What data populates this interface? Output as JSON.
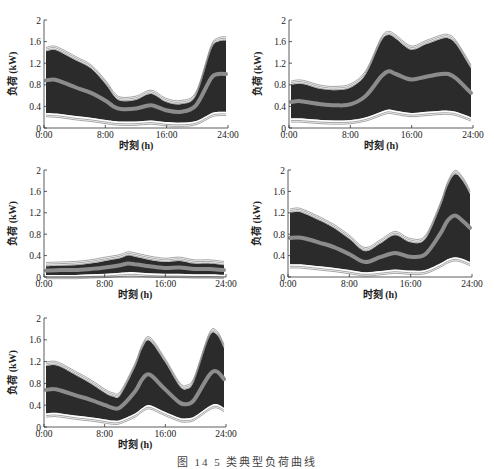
{
  "colors": {
    "band": "#2b2b2b",
    "band_edge": "#6a6a6a",
    "mean": "#8c8c8c",
    "axis": "#333333"
  },
  "caption": "图 14  5 类典型负荷曲线",
  "chart_data": [
    {
      "type": "area",
      "title": "",
      "xlabel": "时刻 (h)",
      "ylabel": "负荷 (kW)",
      "xticks": [
        "0:00",
        "8:00",
        "16:00",
        "24:00"
      ],
      "yticks": [
        "0",
        "0.4",
        "0.8",
        "1.2",
        "1.6",
        "2"
      ],
      "ylim": [
        0,
        2
      ],
      "xlim": [
        0,
        24
      ],
      "x": [
        0,
        1,
        2,
        4,
        6,
        8,
        9,
        10,
        12,
        14,
        16,
        18,
        20,
        22,
        23,
        24
      ],
      "series": [
        {
          "name": "upper",
          "values": [
            1.42,
            1.45,
            1.4,
            1.25,
            1.1,
            0.8,
            0.6,
            0.5,
            0.52,
            0.63,
            0.48,
            0.44,
            0.6,
            1.45,
            1.6,
            1.62
          ]
        },
        {
          "name": "mean",
          "values": [
            0.88,
            0.9,
            0.86,
            0.75,
            0.65,
            0.5,
            0.4,
            0.35,
            0.36,
            0.42,
            0.33,
            0.3,
            0.42,
            0.92,
            1.0,
            1.0
          ]
        },
        {
          "name": "lower",
          "values": [
            0.28,
            0.27,
            0.26,
            0.22,
            0.19,
            0.15,
            0.13,
            0.12,
            0.12,
            0.14,
            0.11,
            0.1,
            0.13,
            0.27,
            0.3,
            0.3
          ]
        }
      ]
    },
    {
      "type": "area",
      "title": "",
      "xlabel": "时刻 (h)",
      "ylabel": "负荷 (kW)",
      "xticks": [
        "0:00",
        "8:00",
        "16:00",
        "24:00"
      ],
      "yticks": [
        "0",
        "0.4",
        "0.8",
        "1.2",
        "1.6",
        "2"
      ],
      "ylim": [
        0,
        2
      ],
      "xlim": [
        0,
        24
      ],
      "x": [
        0,
        1,
        2,
        4,
        6,
        8,
        10,
        12,
        13,
        14,
        16,
        18,
        20,
        21,
        22,
        24
      ],
      "series": [
        {
          "name": "upper",
          "values": [
            0.8,
            0.82,
            0.8,
            0.72,
            0.7,
            0.75,
            1.0,
            1.6,
            1.72,
            1.65,
            1.45,
            1.55,
            1.65,
            1.66,
            1.55,
            1.1
          ]
        },
        {
          "name": "mean",
          "values": [
            0.48,
            0.5,
            0.48,
            0.44,
            0.42,
            0.44,
            0.6,
            0.95,
            1.05,
            1.0,
            0.9,
            0.95,
            1.0,
            1.0,
            0.92,
            0.65
          ]
        },
        {
          "name": "lower",
          "values": [
            0.18,
            0.18,
            0.17,
            0.15,
            0.14,
            0.15,
            0.2,
            0.3,
            0.34,
            0.32,
            0.28,
            0.3,
            0.32,
            0.32,
            0.3,
            0.2
          ]
        }
      ]
    },
    {
      "type": "area",
      "title": "",
      "xlabel": "时刻 (h)",
      "ylabel": "负荷 (kW)",
      "xticks": [
        "0:00",
        "8:00",
        "16:00",
        "24:00"
      ],
      "yticks": [
        "0",
        "0.4",
        "0.8",
        "1.2",
        "1.6",
        "2"
      ],
      "ylim": [
        0,
        2
      ],
      "xlim": [
        0,
        24
      ],
      "x": [
        0,
        2,
        4,
        6,
        8,
        10,
        11,
        12,
        14,
        16,
        18,
        20,
        22,
        24
      ],
      "series": [
        {
          "name": "upper",
          "values": [
            0.2,
            0.21,
            0.22,
            0.25,
            0.3,
            0.35,
            0.4,
            0.38,
            0.32,
            0.28,
            0.3,
            0.25,
            0.25,
            0.22
          ]
        },
        {
          "name": "mean",
          "values": [
            0.12,
            0.13,
            0.13,
            0.15,
            0.18,
            0.22,
            0.25,
            0.24,
            0.2,
            0.17,
            0.18,
            0.15,
            0.15,
            0.13
          ]
        },
        {
          "name": "lower",
          "values": [
            0.04,
            0.04,
            0.04,
            0.05,
            0.06,
            0.08,
            0.09,
            0.09,
            0.07,
            0.06,
            0.06,
            0.05,
            0.05,
            0.04
          ]
        }
      ]
    },
    {
      "type": "area",
      "title": "",
      "xlabel": "时刻 (h)",
      "ylabel": "负荷 (kW)",
      "xticks": [
        "0:00",
        "8:00",
        "16:00",
        "24:00"
      ],
      "yticks": [
        "0",
        "0.4",
        "0.8",
        "1.2",
        "1.6",
        "2"
      ],
      "ylim": [
        0,
        2
      ],
      "xlim": [
        0,
        24
      ],
      "x": [
        0,
        1,
        2,
        4,
        6,
        8,
        10,
        12,
        14,
        16,
        18,
        20,
        21,
        22,
        23,
        24
      ],
      "series": [
        {
          "name": "upper",
          "values": [
            1.2,
            1.22,
            1.18,
            1.05,
            0.9,
            0.7,
            0.48,
            0.62,
            0.78,
            0.65,
            0.7,
            1.3,
            1.7,
            1.92,
            1.8,
            1.55
          ]
        },
        {
          "name": "mean",
          "values": [
            0.73,
            0.74,
            0.72,
            0.64,
            0.55,
            0.42,
            0.28,
            0.37,
            0.45,
            0.38,
            0.42,
            0.8,
            1.05,
            1.15,
            1.05,
            0.92
          ]
        },
        {
          "name": "lower",
          "values": [
            0.24,
            0.24,
            0.23,
            0.2,
            0.17,
            0.13,
            0.09,
            0.11,
            0.14,
            0.12,
            0.13,
            0.25,
            0.33,
            0.37,
            0.34,
            0.28
          ]
        }
      ]
    },
    {
      "type": "area",
      "title": "",
      "xlabel": "时刻 (h)",
      "ylabel": "负荷 (kW)",
      "xticks": [
        "0:00",
        "8:00",
        "16:00",
        "24:00"
      ],
      "yticks": [
        "0",
        "0.4",
        "0.8",
        "1.2",
        "1.6",
        "2"
      ],
      "ylim": [
        0,
        2
      ],
      "xlim": [
        0,
        24
      ],
      "x": [
        0,
        1,
        2,
        4,
        6,
        8,
        9,
        10,
        12,
        13,
        14,
        16,
        18,
        19,
        20,
        22,
        23,
        24
      ],
      "series": [
        {
          "name": "upper",
          "values": [
            1.12,
            1.14,
            1.1,
            0.95,
            0.8,
            0.62,
            0.56,
            0.58,
            1.1,
            1.45,
            1.58,
            1.2,
            0.75,
            0.7,
            0.85,
            1.65,
            1.7,
            1.45
          ]
        },
        {
          "name": "mean",
          "values": [
            0.68,
            0.7,
            0.67,
            0.58,
            0.5,
            0.4,
            0.35,
            0.36,
            0.65,
            0.88,
            0.96,
            0.7,
            0.45,
            0.42,
            0.5,
            0.95,
            1.02,
            0.88
          ]
        },
        {
          "name": "lower",
          "values": [
            0.25,
            0.26,
            0.25,
            0.21,
            0.18,
            0.14,
            0.12,
            0.13,
            0.25,
            0.35,
            0.4,
            0.28,
            0.17,
            0.16,
            0.19,
            0.38,
            0.42,
            0.35
          ]
        }
      ]
    }
  ],
  "panels": [
    {
      "x": 0,
      "y": 0,
      "axisX": 44,
      "axisRight": 228,
      "top": 20,
      "bottom": 128
    },
    {
      "x": 0,
      "y": 0,
      "axisX": 289,
      "axisRight": 473,
      "top": 20,
      "bottom": 128
    },
    {
      "x": 0,
      "y": 0,
      "axisX": 44,
      "axisRight": 226,
      "top": 170,
      "bottom": 277
    },
    {
      "x": 0,
      "y": 0,
      "axisX": 288,
      "axisRight": 472,
      "top": 170,
      "bottom": 277
    },
    {
      "x": 0,
      "y": 0,
      "axisX": 44,
      "axisRight": 226,
      "top": 318,
      "bottom": 427
    }
  ]
}
